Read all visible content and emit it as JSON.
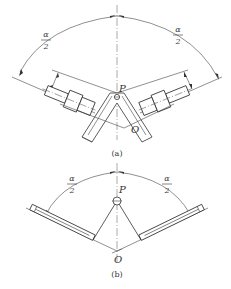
{
  "figure_a": {
    "caption": "(a)",
    "angle_left": {
      "numerator": "α",
      "denominator": "2"
    },
    "angle_right": {
      "numerator": "α",
      "denominator": "2"
    },
    "point_top": "P",
    "point_bottom": "O"
  },
  "figure_b": {
    "caption": "(b)",
    "angle_left": {
      "numerator": "α",
      "denominator": "2"
    },
    "angle_right": {
      "numerator": "α",
      "denominator": "2"
    },
    "point_top": "P",
    "point_bottom": "O"
  },
  "colors": {
    "line": "#333333",
    "background": "#ffffff"
  }
}
